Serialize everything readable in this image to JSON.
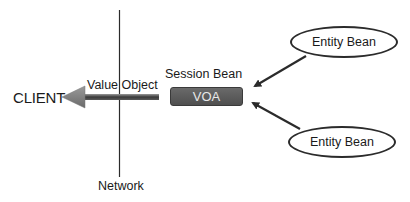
{
  "diagram": {
    "client_label": "CLIENT",
    "value_object_label": "Value Object",
    "session_bean_label": "Session Bean",
    "voa_label": "VOA",
    "network_label": "Network",
    "entity_beans": [
      {
        "label": "Entity Bean"
      },
      {
        "label": "Entity Bean"
      }
    ],
    "colors": {
      "line": "#2b2b2b",
      "voa_fill": "#5c5c5c",
      "voa_text": "#e8e8e8",
      "arrow_fill": "#7a7a7a",
      "arrow_shaft_dark": "#3a3a3a"
    }
  }
}
